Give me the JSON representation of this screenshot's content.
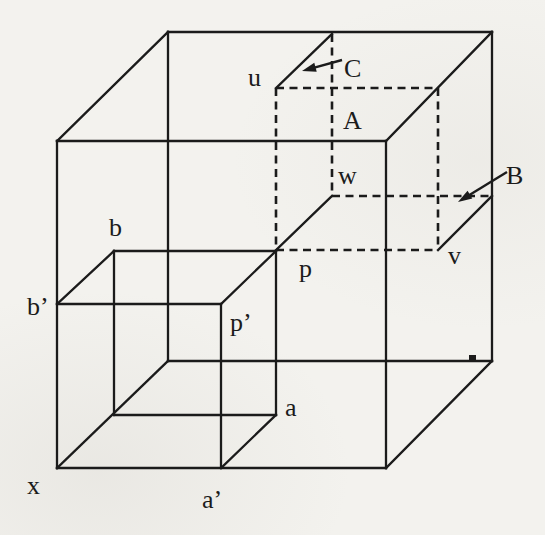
{
  "colors": {
    "ink": "#1b1b1b",
    "paper": "#f3f2ee"
  },
  "diagram": {
    "vertex_labels": [
      {
        "name": "label-u",
        "text": "u",
        "x": 248,
        "y": 86
      },
      {
        "name": "label-w",
        "text": "w",
        "x": 338,
        "y": 184
      },
      {
        "name": "label-v",
        "text": "v",
        "x": 448,
        "y": 264
      },
      {
        "name": "label-p",
        "text": "p",
        "x": 299,
        "y": 277
      },
      {
        "name": "label-p-prime",
        "text": "p’",
        "x": 230,
        "y": 331
      },
      {
        "name": "label-b",
        "text": "b",
        "x": 109,
        "y": 236
      },
      {
        "name": "label-b-prime",
        "text": "b’",
        "x": 27,
        "y": 315
      },
      {
        "name": "label-a",
        "text": "a",
        "x": 285,
        "y": 416
      },
      {
        "name": "label-a-prime",
        "text": "a’",
        "x": 202,
        "y": 508
      },
      {
        "name": "label-x",
        "text": "x",
        "x": 27,
        "y": 494
      }
    ],
    "face_labels": [
      {
        "name": "label-face-A",
        "text": "A",
        "x": 343,
        "y": 129
      },
      {
        "name": "label-face-B",
        "text": "B",
        "x": 506,
        "y": 184
      },
      {
        "name": "label-face-C",
        "text": "C",
        "x": 344,
        "y": 77
      }
    ],
    "solid_lines": [
      {
        "name": "edge-big-front-top",
        "pts": [
          57,
          141,
          386,
          141
        ]
      },
      {
        "name": "edge-big-front-right",
        "pts": [
          386,
          141,
          386,
          468
        ]
      },
      {
        "name": "edge-big-front-bottom",
        "pts": [
          386,
          468,
          57,
          468
        ]
      },
      {
        "name": "edge-big-front-left",
        "pts": [
          57,
          468,
          57,
          141
        ]
      },
      {
        "name": "edge-big-back-top",
        "pts": [
          168,
          32,
          492,
          32
        ]
      },
      {
        "name": "edge-big-back-right",
        "pts": [
          492,
          32,
          492,
          361
        ]
      },
      {
        "name": "edge-big-back-bottom",
        "pts": [
          492,
          361,
          168,
          361
        ]
      },
      {
        "name": "edge-big-back-left",
        "pts": [
          168,
          361,
          168,
          32
        ]
      },
      {
        "name": "edge-big-depth-top-left",
        "pts": [
          57,
          141,
          168,
          32
        ]
      },
      {
        "name": "edge-big-depth-top-right",
        "pts": [
          386,
          141,
          492,
          32
        ]
      },
      {
        "name": "edge-big-depth-bottom-right",
        "pts": [
          386,
          468,
          492,
          361
        ]
      },
      {
        "name": "edge-big-depth-bottom-left",
        "pts": [
          57,
          468,
          168,
          361
        ]
      },
      {
        "name": "edge-small-front-top",
        "pts": [
          57,
          304,
          221,
          304
        ]
      },
      {
        "name": "edge-small-front-right",
        "pts": [
          221,
          304,
          221,
          468
        ]
      },
      {
        "name": "edge-small-back-top",
        "pts": [
          114,
          251,
          276,
          251
        ]
      },
      {
        "name": "edge-small-back-right",
        "pts": [
          276,
          251,
          276,
          415
        ]
      },
      {
        "name": "edge-small-back-bottom",
        "pts": [
          276,
          415,
          114,
          415
        ]
      },
      {
        "name": "edge-small-back-left",
        "pts": [
          114,
          415,
          114,
          251
        ]
      },
      {
        "name": "edge-small-depth-b",
        "pts": [
          57,
          304,
          114,
          251
        ]
      },
      {
        "name": "edge-small-depth-p",
        "pts": [
          221,
          304,
          276,
          251
        ]
      },
      {
        "name": "edge-small-depth-a",
        "pts": [
          221,
          468,
          276,
          415
        ]
      },
      {
        "name": "edge-dashedcube-depth-u",
        "pts": [
          276,
          88,
          332,
          34
        ]
      },
      {
        "name": "edge-dashedcube-depth-p",
        "pts": [
          276,
          250,
          332,
          196
        ]
      },
      {
        "name": "edge-dashedcube-depth-v",
        "pts": [
          438,
          250,
          492,
          196
        ]
      }
    ],
    "dashed_lines": [
      {
        "name": "edge-dashedcube-front-top",
        "pts": [
          276,
          88,
          438,
          88
        ]
      },
      {
        "name": "edge-dashedcube-front-left",
        "pts": [
          276,
          88,
          276,
          250
        ]
      },
      {
        "name": "edge-dashedcube-front-right",
        "pts": [
          438,
          88,
          438,
          250
        ]
      },
      {
        "name": "edge-dashedcube-front-bottom",
        "pts": [
          276,
          250,
          438,
          250
        ]
      },
      {
        "name": "edge-dashedcube-back-left",
        "pts": [
          332,
          34,
          332,
          196
        ]
      },
      {
        "name": "edge-dashedcube-back-bottom",
        "pts": [
          332,
          196,
          492,
          196
        ]
      }
    ],
    "arrows": [
      {
        "name": "arrow-C",
        "x1": 342,
        "y1": 60,
        "x2": 302,
        "y2": 71
      },
      {
        "name": "arrow-B",
        "x1": 507,
        "y1": 172,
        "x2": 458,
        "y2": 202
      }
    ],
    "speck": {
      "x": 469,
      "y": 355,
      "width": 7,
      "height": 5
    }
  }
}
